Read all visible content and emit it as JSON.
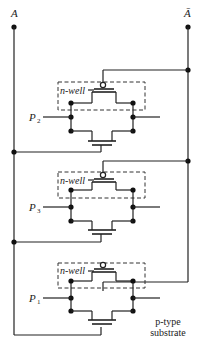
{
  "diagram": {
    "type": "CMOS circuit schematic",
    "inputs": {
      "left_rail_label": "A",
      "right_rail_label": "Ā"
    },
    "stages": [
      {
        "id": "stage-1",
        "select_label": "P",
        "select_subscript": "2",
        "well_label": "n-well"
      },
      {
        "id": "stage-2",
        "select_label": "P",
        "select_subscript": "3",
        "well_label": "n-well"
      },
      {
        "id": "stage-3",
        "select_label": "P",
        "select_subscript": "1",
        "well_label": "n-well"
      }
    ],
    "substrate_label_line1": "p-type",
    "substrate_label_line2": "substrate",
    "colors": {
      "ink": "#222222",
      "background": "#ffffff"
    }
  }
}
